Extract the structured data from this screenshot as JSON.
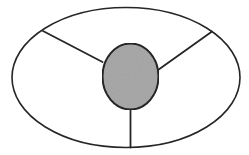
{
  "canvas": {
    "width": 249,
    "height": 155,
    "background_color": "#ffffff",
    "title": ""
  },
  "style": {
    "stroke_color": "#262626",
    "outer_stroke_width": 1.6,
    "spoke_stroke_width": 1.8,
    "hub_stroke_width": 2.0,
    "hub_fill_color": "#a9a9a9",
    "region_fill_color": "#ffffff"
  },
  "shapes": {
    "outer_ellipse": {
      "name": "outer-ellipse",
      "center_x": 126,
      "center_y": 77.5,
      "radius_x": 114,
      "radius_y": 70,
      "fill": "#ffffff",
      "stroke": "#262626"
    },
    "hub_circle": {
      "name": "hub-circle",
      "center_x": 130.5,
      "center_y": 76.5,
      "radius_x": 28,
      "radius_y": 33,
      "fill": "#a9a9a9",
      "stroke": "#262626"
    },
    "spokes": [
      {
        "name": "spoke-upper-left",
        "x1": 102.5,
        "y1": 62.0,
        "x2": 43.0,
        "y2": 31.0
      },
      {
        "name": "spoke-upper-right",
        "x1": 158.0,
        "y1": 70.0,
        "x2": 212.0,
        "y2": 31.5
      },
      {
        "name": "spoke-bottom",
        "x1": 130.5,
        "y1": 109.5,
        "x2": 130.5,
        "y2": 147.5
      }
    ]
  },
  "regions": [
    {
      "name": "region-top",
      "label": ""
    },
    {
      "name": "region-lower-left",
      "label": ""
    },
    {
      "name": "region-lower-right",
      "label": ""
    }
  ],
  "annotations": {
    "labels": [],
    "caption": ""
  }
}
